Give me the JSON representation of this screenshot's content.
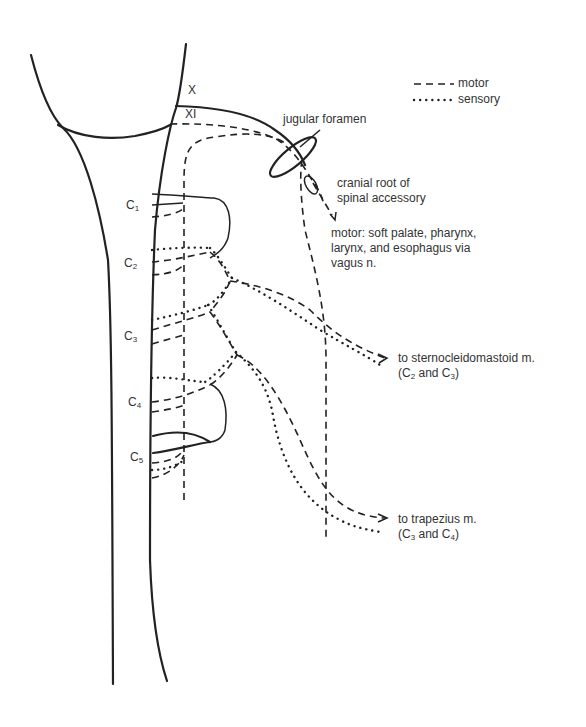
{
  "legend": {
    "motor": "motor",
    "sensory": "sensory"
  },
  "labels": {
    "x": "X",
    "xi": "XI",
    "jugular_foramen": "jugular foramen",
    "cranial_root_line1": "cranial root of",
    "cranial_root_line2": "spinal accessory",
    "motor_target_line1": "motor: soft palate, pharynx,",
    "motor_target_line2": "larynx, and esophagus via",
    "motor_target_line3": "vagus n.",
    "scm_line1": "to sternocleidomastoid m.",
    "scm_open": "(C",
    "scm_sub1": "2",
    "scm_and": " and C",
    "scm_sub2": "3",
    "scm_close": ")",
    "trap_line1": "to trapezius m.",
    "trap_open": "(C",
    "trap_sub1": "3",
    "trap_and": " and C",
    "trap_sub2": "4",
    "trap_close": ")"
  },
  "cervical_levels": [
    {
      "letter": "C",
      "sub": "1"
    },
    {
      "letter": "C",
      "sub": "2"
    },
    {
      "letter": "C",
      "sub": "3"
    },
    {
      "letter": "C",
      "sub": "4"
    },
    {
      "letter": "C",
      "sub": "5"
    }
  ]
}
